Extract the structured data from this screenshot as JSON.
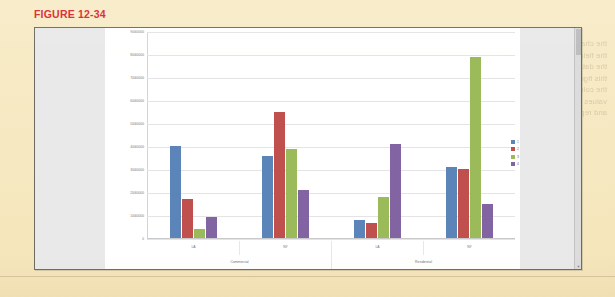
{
  "figure": {
    "caption": "FIGURE 12-34"
  },
  "panel": {
    "scrollbar_up_glyph": "▲",
    "scrollbar_down_glyph": "▼"
  },
  "ghost": {
    "right_block": "the chapter this Capitol a Record in the fields you can figure table and the data formatted appearing when this figure and the for the other all the columns with Grouping the values of the table data is shown and report",
    "left_block": "these values report columns the sample data and summary"
  },
  "chart_data": {
    "type": "bar",
    "title": "",
    "xlabel": "",
    "ylabel": "",
    "ylim": [
      0,
      90000000
    ],
    "grid": true,
    "legend_position": "right",
    "ytick_labels": [
      "90000000",
      "80000000",
      "70000000",
      "60000000",
      "50000000",
      "40000000",
      "30000000",
      "20000000",
      "10000000",
      "0"
    ],
    "ytick_values": [
      90000000,
      80000000,
      70000000,
      60000000,
      50000000,
      40000000,
      30000000,
      20000000,
      10000000,
      0
    ],
    "outer_categories": [
      "Commercial",
      "Residential"
    ],
    "categories": [
      "LA",
      "NY",
      "LA",
      "NY"
    ],
    "legend": [
      "1",
      "2",
      "3",
      "4"
    ],
    "colors": [
      "#5b84b9",
      "#c0504e",
      "#9bba5a",
      "#8264a2"
    ],
    "series": [
      {
        "name": "1",
        "color": "#5b84b9",
        "values": [
          40000000,
          36000000,
          8000000,
          31000000
        ]
      },
      {
        "name": "2",
        "color": "#c0504e",
        "values": [
          17000000,
          55000000,
          6500000,
          30000000
        ]
      },
      {
        "name": "3",
        "color": "#9bba5a",
        "values": [
          4000000,
          39000000,
          18000000,
          79000000
        ]
      },
      {
        "name": "4",
        "color": "#8264a2",
        "values": [
          9000000,
          21000000,
          41000000,
          15000000
        ]
      }
    ]
  }
}
